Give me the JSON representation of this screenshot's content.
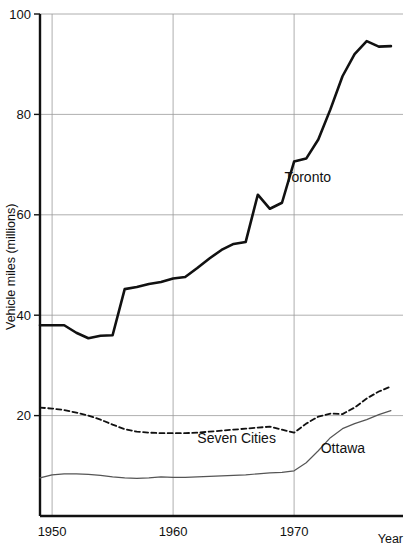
{
  "chart_data": {
    "type": "line",
    "title": "",
    "xlabel": "Year",
    "ylabel": "Vehicle miles (millions)",
    "xlim": [
      1949,
      1979
    ],
    "ylim": [
      0,
      100
    ],
    "xticks": [
      1950,
      1960,
      1970
    ],
    "xtick_labels": [
      "1950",
      "1960",
      "1970"
    ],
    "yticks": [
      20,
      40,
      60,
      80,
      100
    ],
    "ytick_labels": [
      "20",
      "40",
      "60",
      "80",
      "100"
    ],
    "grid": true,
    "grid_color": "#9a9a9a",
    "legend_position": "inline-annotations",
    "x": [
      1949,
      1950,
      1951,
      1952,
      1953,
      1954,
      1955,
      1956,
      1957,
      1958,
      1959,
      1960,
      1961,
      1962,
      1963,
      1964,
      1965,
      1966,
      1967,
      1968,
      1969,
      1970,
      1971,
      1972,
      1973,
      1974,
      1975,
      1976,
      1977,
      1978
    ],
    "series": [
      {
        "name": "Toronto",
        "style": "solid",
        "color": "#111111",
        "width": 2.6,
        "label_x": 1969.2,
        "label_y": 66.5,
        "values": [
          38.0,
          38.0,
          38.0,
          36.5,
          35.4,
          35.9,
          36.0,
          45.2,
          45.6,
          46.2,
          46.6,
          47.3,
          47.6,
          49.4,
          51.3,
          53.0,
          54.2,
          54.6,
          64.0,
          61.2,
          62.4,
          70.6,
          71.2,
          75.0,
          81.0,
          87.6,
          92.0,
          94.6,
          93.5,
          93.6
        ]
      },
      {
        "name": "Seven Cities",
        "style": "dashed",
        "color": "#111111",
        "width": 1.8,
        "label_x": 1962.0,
        "label_y": 14.6,
        "values": [
          21.6,
          21.4,
          21.1,
          20.6,
          20.0,
          19.2,
          18.2,
          17.3,
          16.8,
          16.6,
          16.5,
          16.5,
          16.5,
          16.6,
          16.8,
          17.0,
          17.2,
          17.4,
          17.6,
          17.8,
          17.2,
          16.6,
          18.4,
          19.8,
          20.4,
          20.3,
          21.6,
          23.4,
          24.8,
          25.8
        ]
      },
      {
        "name": "Ottawa",
        "style": "solid",
        "color": "#555555",
        "width": 1.2,
        "label_x": 1972.2,
        "label_y": 12.6,
        "values": [
          7.6,
          8.2,
          8.4,
          8.4,
          8.3,
          8.1,
          7.8,
          7.6,
          7.5,
          7.6,
          7.8,
          7.7,
          7.7,
          7.8,
          7.9,
          8.0,
          8.1,
          8.2,
          8.4,
          8.6,
          8.7,
          9.0,
          10.6,
          13.0,
          15.6,
          17.4,
          18.4,
          19.2,
          20.2,
          21.0
        ]
      }
    ]
  },
  "axes": {
    "y_title": "Vehicle miles (millions)",
    "x_title": "Year"
  }
}
